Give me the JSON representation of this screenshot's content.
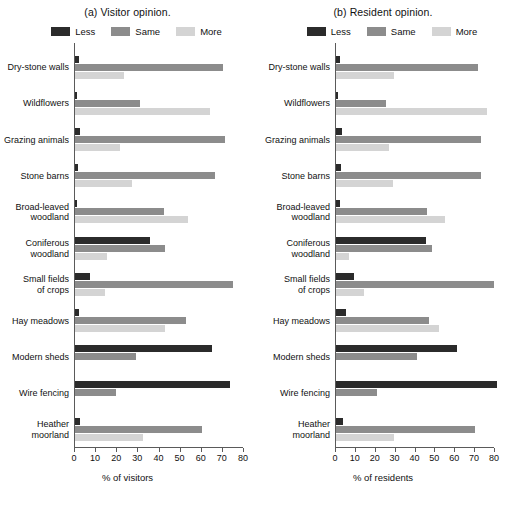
{
  "figure": {
    "panels": [
      {
        "id": "panel-a",
        "title": "(a) Visitor opinion.",
        "xlabel": "% of visitors"
      },
      {
        "id": "panel-b",
        "title": "(b) Resident opinion.",
        "xlabel": "% of residents"
      }
    ],
    "legend": [
      {
        "label": "Less",
        "color": "#2b2b2b"
      },
      {
        "label": "Same",
        "color": "#8c8c8c"
      },
      {
        "label": "More",
        "color": "#d4d4d4"
      }
    ],
    "ticks": [
      "0",
      "10",
      "20",
      "30",
      "40",
      "50",
      "60",
      "70",
      "80"
    ]
  },
  "chart_data": [
    {
      "type": "bar",
      "title": "(a) Visitor opinion.",
      "orientation": "horizontal",
      "xlabel": "% of visitors",
      "ylabel": "",
      "xlim": [
        0,
        80
      ],
      "xticks": [
        0,
        10,
        20,
        30,
        40,
        50,
        60,
        70,
        80
      ],
      "grid": false,
      "legend_position": "top",
      "categories": [
        "Dry-stone walls",
        "Wildflowers",
        "Grazing animals",
        "Stone barns",
        "Broad-leaved woodland",
        "Coniferous woodland",
        "Small fields of crops",
        "Hay meadows",
        "Modern sheds",
        "Wire fencing",
        "Heather moorland"
      ],
      "series": [
        {
          "name": "Less",
          "color": "#2b2b2b",
          "values": [
            2,
            1,
            2.5,
            1.5,
            1,
            35.5,
            7,
            2,
            65,
            73.5,
            2.5
          ]
        },
        {
          "name": "Same",
          "color": "#8c8c8c",
          "values": [
            70,
            31,
            71,
            66.5,
            42,
            42.5,
            75,
            52.5,
            29,
            19.5,
            60
          ]
        },
        {
          "name": "More",
          "color": "#d4d4d4",
          "values": [
            23,
            64,
            21.5,
            27,
            53.5,
            15,
            14,
            42.5,
            0,
            0,
            32
          ]
        }
      ]
    },
    {
      "type": "bar",
      "title": "(b) Resident opinion.",
      "orientation": "horizontal",
      "xlabel": "% of residents",
      "ylabel": "",
      "xlim": [
        0,
        80
      ],
      "xticks": [
        0,
        10,
        20,
        30,
        40,
        50,
        60,
        70,
        80
      ],
      "grid": false,
      "legend_position": "top",
      "categories": [
        "Dry-stone walls",
        "Wildflowers",
        "Grazing animals",
        "Stone barns",
        "Broad-leaved woodland",
        "Coniferous woodland",
        "Small fields of crops",
        "Hay meadows",
        "Modern sheds",
        "Wire fencing",
        "Heather moorland"
      ],
      "series": [
        {
          "name": "Less",
          "color": "#2b2b2b",
          "values": [
            2,
            1,
            3,
            2.5,
            2,
            45.5,
            9,
            5,
            61,
            81,
            3.5
          ]
        },
        {
          "name": "Same",
          "color": "#8c8c8c",
          "values": [
            71.5,
            25,
            73,
            73,
            46,
            48.5,
            79.5,
            47,
            41,
            20.5,
            70
          ]
        },
        {
          "name": "More",
          "color": "#d4d4d4",
          "values": [
            29,
            76,
            26.5,
            28.5,
            55,
            6.5,
            14,
            52,
            0,
            0,
            29
          ]
        }
      ]
    }
  ]
}
